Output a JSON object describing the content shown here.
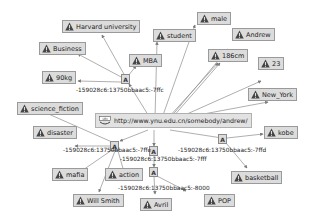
{
  "diagram": {
    "type": "rdf-graph",
    "resource": {
      "id": "uri",
      "icon": "uri-icon",
      "label": "http://www.ynu.edu.cn/somebody/andrew/"
    },
    "blank_nodes": [
      {
        "id": "a1",
        "label": "A"
      },
      {
        "id": "a2",
        "label": "A"
      },
      {
        "id": "a3",
        "label": "A"
      },
      {
        "id": "a4",
        "label": "A"
      },
      {
        "id": "a5",
        "label": "A"
      }
    ],
    "literals": [
      {
        "id": "harvard",
        "label": "Harvard university"
      },
      {
        "id": "business",
        "label": "Business"
      },
      {
        "id": "mba",
        "label": "MBA"
      },
      {
        "id": "weight",
        "label": "90kg"
      },
      {
        "id": "student",
        "label": "student"
      },
      {
        "id": "male",
        "label": "male"
      },
      {
        "id": "andrew",
        "label": "Andrew"
      },
      {
        "id": "height",
        "label": "186cm"
      },
      {
        "id": "age",
        "label": "23"
      },
      {
        "id": "newyork",
        "label": "New_York"
      },
      {
        "id": "scifi",
        "label": "science_fiction"
      },
      {
        "id": "disaster",
        "label": "disaster"
      },
      {
        "id": "kobe",
        "label": "kobe"
      },
      {
        "id": "mafia",
        "label": "mafia"
      },
      {
        "id": "action",
        "label": "action"
      },
      {
        "id": "willsmith",
        "label": "Will Smith"
      },
      {
        "id": "basketball",
        "label": "basketball"
      },
      {
        "id": "avril",
        "label": "Avril"
      },
      {
        "id": "pop",
        "label": "POP"
      }
    ],
    "edge_labels": [
      {
        "id": "e1",
        "label": "-159028c6:13750bbaac5:-7ffc"
      },
      {
        "id": "e2",
        "label": "-159028c6:13750bbaac5:-7ffe"
      },
      {
        "id": "e3",
        "label": "-159028c6:13750bbaac5:-7ffd"
      },
      {
        "id": "e4",
        "label": "-159028c6:13750bbaac5:-7fff"
      },
      {
        "id": "e5",
        "label": "-159028c6:13750bbaac5:-8000"
      }
    ],
    "colors": {
      "node_fill": "#dcdcdc",
      "node_border": "#9a9a9a",
      "edge": "#8c8c8c",
      "warning_icon": "#444444"
    }
  }
}
